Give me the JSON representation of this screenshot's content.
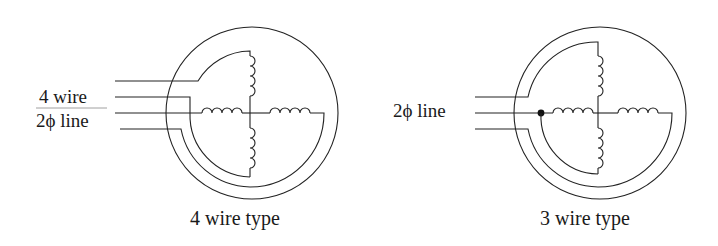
{
  "diagrams": [
    {
      "id": "four-wire",
      "caption": "4 wire type",
      "labels": {
        "upper": "4 wire",
        "lower": "2ϕ line"
      },
      "wire_count": 4,
      "center": [
        252,
        113
      ],
      "outer_radius": 85
    },
    {
      "id": "three-wire",
      "caption": "3 wire type",
      "labels": {
        "main": "2ϕ line"
      },
      "wire_count": 3,
      "center": [
        600,
        113
      ],
      "outer_radius": 85,
      "common_junction_dot": true
    }
  ],
  "colors": {
    "line": "#222222",
    "background": "#ffffff"
  }
}
